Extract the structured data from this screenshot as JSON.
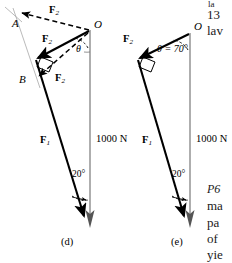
{
  "figure": {
    "panels": [
      {
        "caption": "(d)",
        "points": {
          "O": "O",
          "A": "A",
          "B": "B"
        },
        "angle_theta": "θ",
        "angle_ground": "20°",
        "load_label": "1000 N",
        "vectors": [
          {
            "name": "F2-upper-dashed",
            "label": "F",
            "sub": "2"
          },
          {
            "name": "F2-solid",
            "label": "F",
            "sub": "2"
          },
          {
            "name": "F2-lower-dashed",
            "label": "F",
            "sub": "2"
          },
          {
            "name": "F1",
            "label": "F",
            "sub": "1"
          }
        ]
      },
      {
        "caption": "(e)",
        "points": {
          "O": "O"
        },
        "angle_theta": "θ = 70°",
        "angle_ground": "20°",
        "load_label": "1000 N",
        "vectors": [
          {
            "name": "F2-solid",
            "label": "F",
            "sub": "2"
          },
          {
            "name": "F1",
            "label": "F",
            "sub": "1"
          }
        ]
      }
    ]
  },
  "margin_text": {
    "top_lines": [
      "la",
      "13",
      "lav"
    ],
    "bottom_lines": [
      "P6",
      "ma",
      "pa",
      "of",
      "yie"
    ]
  },
  "colors": {
    "ink": "#000000",
    "load_line": "#8c8c8c",
    "construction": "#9a9a9a",
    "margin_ink": "#1a1a1a"
  }
}
